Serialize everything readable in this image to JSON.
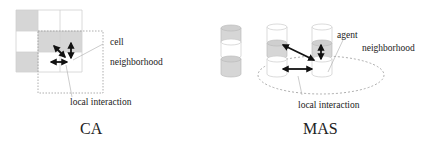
{
  "ca": {
    "title": "CA",
    "labels": {
      "cell": "cell",
      "neighborhood": "neighborhood",
      "local_interaction": "local interaction"
    },
    "colors": {
      "filled_cell": "#d6d6d6",
      "grid_line": "#c8c8c8"
    }
  },
  "mas": {
    "title": "MAS",
    "labels": {
      "agent": "agent",
      "neighborhood": "neighborhood",
      "local_interaction": "local interaction"
    },
    "colors": {
      "filled_segment": "#d6d6d6",
      "outline": "#bbbbbb"
    }
  }
}
